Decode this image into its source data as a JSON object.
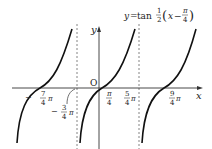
{
  "figure": {
    "equation": {
      "lhs": "y",
      "eq": "=",
      "func": "tan",
      "frac_num": "1",
      "frac_den": "2",
      "lparen": "(",
      "var": "x",
      "minus": "−",
      "pi_num": "π",
      "pi_den": "4",
      "rparen": ")"
    },
    "axes": {
      "x_label": "x",
      "y_label": "y",
      "origin_label": "O"
    },
    "tick_labels": [
      {
        "sign": "−",
        "num": "7",
        "den": "4",
        "suffix": "π"
      },
      {
        "sign": "−",
        "num": "3",
        "den": "4",
        "suffix": "π"
      },
      {
        "sign": "",
        "num": "π",
        "den": "4",
        "suffix": ""
      },
      {
        "sign": "",
        "num": "5",
        "den": "4",
        "suffix": "π"
      },
      {
        "sign": "",
        "num": "9",
        "den": "4",
        "suffix": "π"
      }
    ],
    "asymptotes": [
      "x = -3π/4",
      "x = 5π/4"
    ],
    "zeros": [
      "-7π/4",
      "π/4",
      "9π/4"
    ],
    "colors": {
      "curve": "#111111",
      "axis": "#333333",
      "asymptote": "#666666"
    }
  }
}
